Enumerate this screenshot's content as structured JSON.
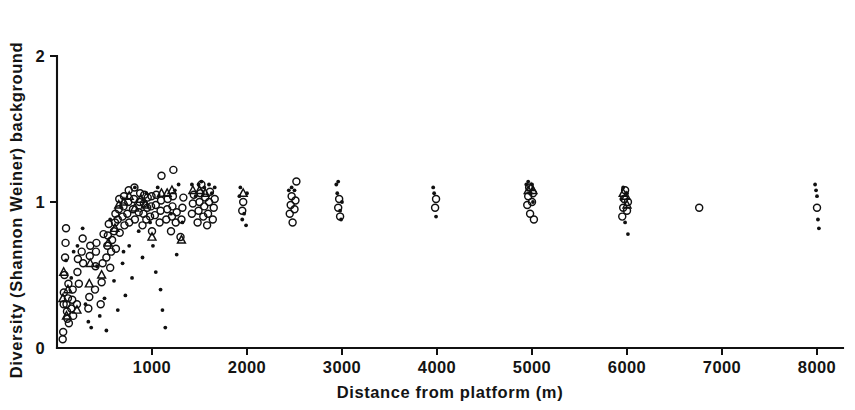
{
  "figure": {
    "background_color": "#ffffff",
    "ink_color": "#111111"
  },
  "chart_data": {
    "type": "scatter",
    "title": "",
    "xlabel": "Distance from platform   (m)",
    "ylabel": "Diversity (Shannon Weiner) background",
    "xlim": [
      0,
      8400
    ],
    "ylim": [
      0,
      2
    ],
    "xticks": [
      1000,
      2000,
      3000,
      4000,
      5000,
      6000,
      7000,
      8000
    ],
    "xticklabels": [
      "1000",
      "2000",
      "3000",
      "4000",
      "5000",
      "6000",
      "7000",
      "8000"
    ],
    "yticks": [
      0,
      1,
      2
    ],
    "yticklabels": [
      "0",
      "1",
      "2"
    ],
    "grid": false,
    "legend": "none",
    "axis_style": "left-and-bottom-spines",
    "series": [
      {
        "name": "open-circle",
        "marker": "open circle",
        "points": [
          [
            60,
            0.06
          ],
          [
            65,
            0.11
          ],
          [
            70,
            0.3
          ],
          [
            72,
            0.38
          ],
          [
            78,
            0.5
          ],
          [
            85,
            0.62
          ],
          [
            90,
            0.72
          ],
          [
            95,
            0.82
          ],
          [
            100,
            0.3
          ],
          [
            105,
            0.25
          ],
          [
            110,
            0.2
          ],
          [
            115,
            0.34
          ],
          [
            120,
            0.44
          ],
          [
            125,
            0.17
          ],
          [
            150,
            0.27
          ],
          [
            160,
            0.33
          ],
          [
            165,
            0.4
          ],
          [
            170,
            0.22
          ],
          [
            210,
            0.3
          ],
          [
            215,
            0.52
          ],
          [
            220,
            0.61
          ],
          [
            230,
            0.44
          ],
          [
            260,
            0.66
          ],
          [
            270,
            0.75
          ],
          [
            275,
            0.58
          ],
          [
            330,
            0.27
          ],
          [
            340,
            0.35
          ],
          [
            345,
            0.63
          ],
          [
            350,
            0.7
          ],
          [
            400,
            0.4
          ],
          [
            405,
            0.56
          ],
          [
            410,
            0.66
          ],
          [
            415,
            0.72
          ],
          [
            460,
            0.3
          ],
          [
            470,
            0.45
          ],
          [
            480,
            0.58
          ],
          [
            490,
            0.78
          ],
          [
            520,
            0.62
          ],
          [
            530,
            0.7
          ],
          [
            535,
            0.77
          ],
          [
            545,
            0.85
          ],
          [
            560,
            0.55
          ],
          [
            570,
            0.66
          ],
          [
            580,
            0.74
          ],
          [
            600,
            0.8
          ],
          [
            610,
            0.86
          ],
          [
            615,
            0.92
          ],
          [
            620,
            0.68
          ],
          [
            640,
            0.88
          ],
          [
            650,
            0.95
          ],
          [
            655,
            1.02
          ],
          [
            660,
            0.79
          ],
          [
            690,
            0.9
          ],
          [
            700,
            0.97
          ],
          [
            705,
            1.04
          ],
          [
            710,
            0.84
          ],
          [
            740,
            0.92
          ],
          [
            750,
            1.0
          ],
          [
            755,
            1.08
          ],
          [
            760,
            0.86
          ],
          [
            800,
            0.95
          ],
          [
            810,
            1.02
          ],
          [
            815,
            1.1
          ],
          [
            820,
            0.88
          ],
          [
            860,
            0.93
          ],
          [
            870,
            1.0
          ],
          [
            875,
            1.06
          ],
          [
            900,
            0.84
          ],
          [
            910,
            0.92
          ],
          [
            915,
            0.99
          ],
          [
            920,
            1.05
          ],
          [
            940,
            0.88
          ],
          [
            950,
            0.96
          ],
          [
            955,
            1.03
          ],
          [
            980,
            0.9
          ],
          [
            990,
            0.97
          ],
          [
            995,
            1.04
          ],
          [
            1000,
            0.8
          ],
          [
            1030,
            0.91
          ],
          [
            1040,
            0.98
          ],
          [
            1045,
            1.05
          ],
          [
            1080,
            0.86
          ],
          [
            1090,
            0.94
          ],
          [
            1095,
            1.01
          ],
          [
            1100,
            1.18
          ],
          [
            1150,
            0.88
          ],
          [
            1160,
            0.95
          ],
          [
            1165,
            1.02
          ],
          [
            1200,
            0.8
          ],
          [
            1210,
            0.9
          ],
          [
            1215,
            0.97
          ],
          [
            1220,
            1.04
          ],
          [
            1225,
            1.22
          ],
          [
            1250,
            0.86
          ],
          [
            1260,
            0.93
          ],
          [
            1300,
            0.76
          ],
          [
            1310,
            0.88
          ],
          [
            1320,
            0.96
          ],
          [
            1330,
            1.03
          ],
          [
            1420,
            0.92
          ],
          [
            1430,
            0.99
          ],
          [
            1440,
            1.05
          ],
          [
            1480,
            0.86
          ],
          [
            1490,
            0.94
          ],
          [
            1500,
            1.0
          ],
          [
            1510,
            1.06
          ],
          [
            1520,
            1.12
          ],
          [
            1540,
            0.9
          ],
          [
            1550,
            0.97
          ],
          [
            1560,
            1.03
          ],
          [
            1580,
            0.84
          ],
          [
            1590,
            0.92
          ],
          [
            1600,
            1.0
          ],
          [
            1610,
            1.07
          ],
          [
            1640,
            0.88
          ],
          [
            1650,
            0.96
          ],
          [
            1660,
            1.02
          ],
          [
            1950,
            0.94
          ],
          [
            1960,
            1.0
          ],
          [
            2450,
            0.92
          ],
          [
            2460,
            0.98
          ],
          [
            2470,
            1.04
          ],
          [
            2480,
            0.86
          ],
          [
            2500,
            0.95
          ],
          [
            2510,
            1.01
          ],
          [
            2520,
            1.14
          ],
          [
            2960,
            0.96
          ],
          [
            2970,
            1.02
          ],
          [
            2980,
            0.9
          ],
          [
            3980,
            0.96
          ],
          [
            3990,
            1.02
          ],
          [
            4950,
            0.98
          ],
          [
            4960,
            1.04
          ],
          [
            4970,
            1.1
          ],
          [
            4980,
            0.92
          ],
          [
            5000,
            1.0
          ],
          [
            5010,
            1.06
          ],
          [
            5020,
            0.88
          ],
          [
            5950,
            0.9
          ],
          [
            5960,
            0.96
          ],
          [
            5970,
            1.02
          ],
          [
            5980,
            1.08
          ],
          [
            6000,
            0.94
          ],
          [
            6010,
            1.0
          ],
          [
            6760,
            0.96
          ],
          [
            8000,
            0.96
          ]
        ]
      },
      {
        "name": "triangle",
        "marker": "open triangle",
        "points": [
          [
            62,
            0.34
          ],
          [
            70,
            0.52
          ],
          [
            100,
            0.22
          ],
          [
            115,
            0.4
          ],
          [
            210,
            0.26
          ],
          [
            340,
            0.44
          ],
          [
            350,
            0.58
          ],
          [
            470,
            0.5
          ],
          [
            540,
            0.72
          ],
          [
            610,
            0.82
          ],
          [
            650,
            0.98
          ],
          [
            705,
            1.0
          ],
          [
            760,
            1.04
          ],
          [
            820,
            0.96
          ],
          [
            880,
            1.02
          ],
          [
            930,
            0.98
          ],
          [
            1000,
            0.76
          ],
          [
            1100,
            1.06
          ],
          [
            1160,
            1.06
          ],
          [
            1210,
            1.08
          ],
          [
            1310,
            0.74
          ],
          [
            1430,
            1.08
          ],
          [
            1500,
            1.08
          ],
          [
            1560,
            1.06
          ],
          [
            1960,
            1.06
          ],
          [
            4960,
            1.08
          ],
          [
            4990,
            1.1
          ],
          [
            5010,
            1.08
          ],
          [
            5960,
            1.06
          ],
          [
            5990,
            1.04
          ],
          [
            6000,
            0.98
          ]
        ]
      },
      {
        "name": "small-dot",
        "marker": "filled dot",
        "points": [
          [
            95,
            0.6
          ],
          [
            150,
            0.48
          ],
          [
            175,
            0.66
          ],
          [
            215,
            0.7
          ],
          [
            270,
            0.82
          ],
          [
            300,
            0.3
          ],
          [
            330,
            0.18
          ],
          [
            360,
            0.14
          ],
          [
            420,
            0.56
          ],
          [
            450,
            0.22
          ],
          [
            500,
            0.34
          ],
          [
            520,
            0.12
          ],
          [
            560,
            0.88
          ],
          [
            600,
            0.46
          ],
          [
            640,
            0.26
          ],
          [
            690,
            0.58
          ],
          [
            700,
            0.66
          ],
          [
            720,
            0.36
          ],
          [
            760,
            0.7
          ],
          [
            790,
            0.48
          ],
          [
            820,
            1.1
          ],
          [
            860,
            0.8
          ],
          [
            900,
            0.62
          ],
          [
            940,
            1.06
          ],
          [
            980,
            0.86
          ],
          [
            1010,
            0.7
          ],
          [
            1040,
            0.52
          ],
          [
            1060,
            1.1
          ],
          [
            1090,
            0.4
          ],
          [
            1110,
            0.26
          ],
          [
            1140,
            0.14
          ],
          [
            1200,
            0.92
          ],
          [
            1240,
            1.08
          ],
          [
            1260,
            0.64
          ],
          [
            1280,
            1.12
          ],
          [
            1320,
            0.86
          ],
          [
            1420,
            1.12
          ],
          [
            1460,
            1.04
          ],
          [
            1490,
            1.12
          ],
          [
            1520,
            1.14
          ],
          [
            1550,
            1.1
          ],
          [
            1600,
            1.12
          ],
          [
            1630,
            1.06
          ],
          [
            1660,
            1.1
          ],
          [
            1920,
            1.04
          ],
          [
            1930,
            1.1
          ],
          [
            1950,
            0.88
          ],
          [
            1970,
            0.92
          ],
          [
            1990,
            0.84
          ],
          [
            2000,
            1.06
          ],
          [
            2440,
            1.08
          ],
          [
            2470,
            1.1
          ],
          [
            2500,
            1.08
          ],
          [
            2940,
            1.12
          ],
          [
            2950,
            1.06
          ],
          [
            2960,
            1.14
          ],
          [
            2980,
            0.94
          ],
          [
            2990,
            0.88
          ],
          [
            3000,
            1.0
          ],
          [
            3960,
            1.1
          ],
          [
            3970,
            1.06
          ],
          [
            3990,
            0.9
          ],
          [
            4940,
            1.12
          ],
          [
            4960,
            1.14
          ],
          [
            4980,
            1.06
          ],
          [
            5000,
            1.12
          ],
          [
            5010,
            1.0
          ],
          [
            5940,
            1.02
          ],
          [
            5960,
            1.1
          ],
          [
            5980,
            0.86
          ],
          [
            6000,
            1.06
          ],
          [
            6010,
            0.78
          ],
          [
            7980,
            1.12
          ],
          [
            7990,
            1.08
          ],
          [
            8000,
            1.04
          ],
          [
            8010,
            0.88
          ],
          [
            8020,
            0.82
          ]
        ]
      }
    ]
  }
}
